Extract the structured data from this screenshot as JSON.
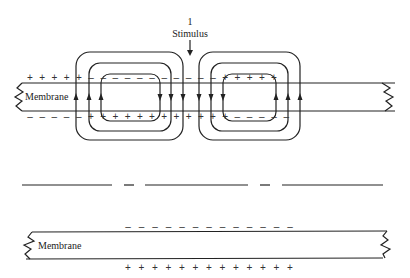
{
  "figure": {
    "stimulus_number": "1",
    "stimulus_label": "Stimulus",
    "membrane_label_top": "Membrane",
    "membrane_label_bottom": "Membrane",
    "plus_sign": "+",
    "minus_sign": "–"
  },
  "top_membrane": {
    "outer_charges": [
      "+",
      "+",
      "+",
      "+",
      "+",
      "–",
      "–",
      "–",
      "–",
      "–",
      "–",
      "–",
      "–",
      "–",
      "–",
      "–",
      "+",
      "+",
      "+",
      "+",
      "+"
    ],
    "inner_charges": [
      "–",
      "–",
      "–",
      "–",
      "–",
      "+",
      "+",
      "+",
      "+",
      "+",
      "+",
      "+",
      "+",
      "+",
      "+",
      "+",
      "+",
      "–",
      "–",
      "–",
      "–",
      "–"
    ],
    "loops": [
      {
        "name": "left-current-loops",
        "direction": "up-left-down-right"
      },
      {
        "name": "right-current-loops",
        "direction": "down-left-up-right"
      }
    ]
  },
  "bottom_membrane": {
    "outer_charges": [
      "–",
      "–",
      "–",
      "–",
      "–",
      "–",
      "–",
      "–",
      "–",
      "–",
      "–",
      "–",
      "–"
    ],
    "inner_charges": [
      "+",
      "+",
      "+",
      "+",
      "+",
      "+",
      "+",
      "+",
      "+",
      "+",
      "+",
      "+",
      "+"
    ]
  }
}
